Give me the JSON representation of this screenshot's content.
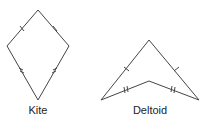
{
  "shapes": [
    {
      "name": "kite",
      "label": "Kite",
      "vertices": [
        [
          38,
          10
        ],
        [
          69,
          46
        ],
        [
          38,
          100
        ],
        [
          7,
          46
        ]
      ],
      "tick_marks": {
        "upper_sides": 1,
        "lower_sides": 2
      },
      "label_pos": [
        38,
        105
      ]
    },
    {
      "name": "deltoid",
      "label": "Deltoid",
      "vertices": [
        [
          149,
          40
        ],
        [
          199,
          100
        ],
        [
          149,
          81
        ],
        [
          101,
          100
        ]
      ],
      "tick_marks": {
        "outer_sides": 1,
        "inner_sides": 2
      },
      "label_pos": [
        150,
        105
      ]
    }
  ],
  "colors": {
    "stroke": "#444444",
    "text": "#222222",
    "background": "#ffffff"
  }
}
